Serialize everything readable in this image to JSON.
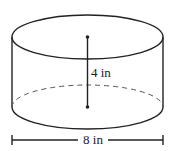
{
  "diagram": {
    "shape": "cylinder",
    "height_label": "4 in",
    "diameter_label": "8 in",
    "stroke_color": "#222222",
    "background": "#ffffff"
  }
}
